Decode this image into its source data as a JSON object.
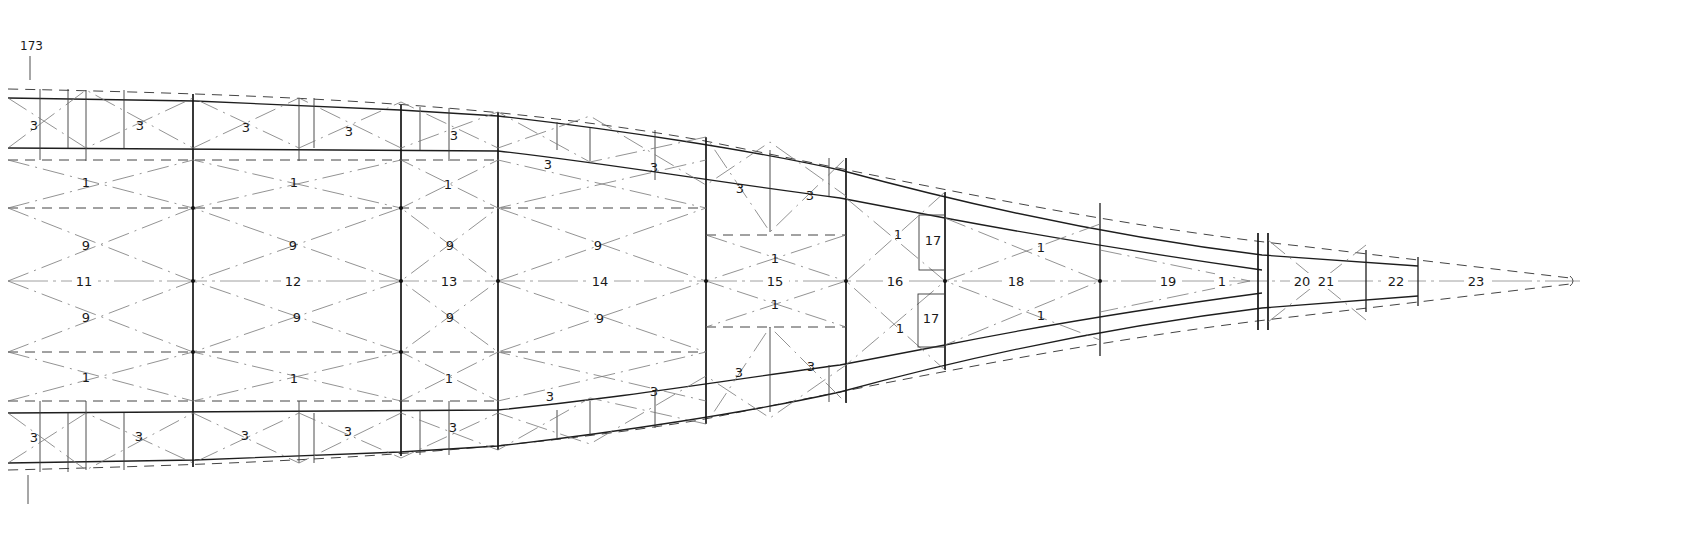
{
  "drawing": {
    "reference_number": "173",
    "description": "Tapering truss / frame panel layout with numbered members",
    "colors": {
      "ink": "#1e1e1e",
      "background": "#ffffff",
      "construction": "#777777"
    },
    "bay_labels": [
      {
        "text": "11",
        "x": 84,
        "y": 281
      },
      {
        "text": "12",
        "x": 293,
        "y": 281
      },
      {
        "text": "13",
        "x": 449,
        "y": 281
      },
      {
        "text": "14",
        "x": 600,
        "y": 281
      },
      {
        "text": "15",
        "x": 775,
        "y": 281
      },
      {
        "text": "16",
        "x": 895,
        "y": 281
      },
      {
        "text": "18",
        "x": 1016,
        "y": 281
      },
      {
        "text": "19",
        "x": 1168,
        "y": 281
      },
      {
        "text": "1",
        "x": 1222,
        "y": 281
      },
      {
        "text": "20",
        "x": 1302,
        "y": 281
      },
      {
        "text": "21",
        "x": 1326,
        "y": 281
      },
      {
        "text": "22",
        "x": 1396,
        "y": 281
      },
      {
        "text": "23",
        "x": 1476,
        "y": 281
      }
    ],
    "diagonal_labels_9": [
      {
        "text": "9",
        "x": 86,
        "y": 245
      },
      {
        "text": "9",
        "x": 293,
        "y": 245
      },
      {
        "text": "9",
        "x": 450,
        "y": 245
      },
      {
        "text": "9",
        "x": 598,
        "y": 245
      },
      {
        "text": "9",
        "x": 86,
        "y": 317
      },
      {
        "text": "9",
        "x": 297,
        "y": 317
      },
      {
        "text": "9",
        "x": 450,
        "y": 317
      },
      {
        "text": "9",
        "x": 600,
        "y": 318
      }
    ],
    "diagonal_labels_1": [
      {
        "text": "1",
        "x": 86,
        "y": 182
      },
      {
        "text": "1",
        "x": 294,
        "y": 182
      },
      {
        "text": "1",
        "x": 448,
        "y": 184
      },
      {
        "text": "1",
        "x": 86,
        "y": 377
      },
      {
        "text": "1",
        "x": 294,
        "y": 378
      },
      {
        "text": "1",
        "x": 449,
        "y": 378
      },
      {
        "text": "1",
        "x": 775,
        "y": 258
      },
      {
        "text": "1",
        "x": 775,
        "y": 304
      },
      {
        "text": "1",
        "x": 898,
        "y": 234
      },
      {
        "text": "1",
        "x": 900,
        "y": 328
      },
      {
        "text": "1",
        "x": 1041,
        "y": 247
      },
      {
        "text": "1",
        "x": 1041,
        "y": 315
      }
    ],
    "chord_labels_3": [
      {
        "text": "3",
        "x": 34,
        "y": 125
      },
      {
        "text": "3",
        "x": 140,
        "y": 125
      },
      {
        "text": "3",
        "x": 246,
        "y": 127
      },
      {
        "text": "3",
        "x": 349,
        "y": 131
      },
      {
        "text": "3",
        "x": 454,
        "y": 135
      },
      {
        "text": "3",
        "x": 548,
        "y": 164
      },
      {
        "text": "3",
        "x": 654,
        "y": 167
      },
      {
        "text": "3",
        "x": 740,
        "y": 188
      },
      {
        "text": "3",
        "x": 810,
        "y": 195
      },
      {
        "text": "3",
        "x": 34,
        "y": 437
      },
      {
        "text": "3",
        "x": 139,
        "y": 436
      },
      {
        "text": "3",
        "x": 245,
        "y": 435
      },
      {
        "text": "3",
        "x": 348,
        "y": 431
      },
      {
        "text": "3",
        "x": 453,
        "y": 427
      },
      {
        "text": "3",
        "x": 550,
        "y": 396
      },
      {
        "text": "3",
        "x": 654,
        "y": 391
      },
      {
        "text": "3",
        "x": 739,
        "y": 372
      },
      {
        "text": "3",
        "x": 811,
        "y": 366
      }
    ],
    "box_labels_17": [
      {
        "text": "17",
        "x": 933,
        "y": 240
      },
      {
        "text": "17",
        "x": 931,
        "y": 318
      }
    ]
  }
}
